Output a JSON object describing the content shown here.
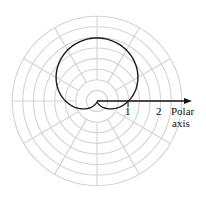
{
  "diagram": {
    "type": "polar-plot",
    "curve_equation_shape": "cardioid",
    "labels": {
      "tick_1": "1",
      "tick_2": "2",
      "axis_line1": "Polar",
      "axis_line2": "axis"
    },
    "colors": {
      "grid": "#d4d4d4",
      "curve": "#1a1a1a",
      "axis": "#111111",
      "background": "#ffffff"
    }
  },
  "chart_data": {
    "type": "line",
    "title": "",
    "coordinate_system": "polar",
    "series": [
      {
        "name": "cardioid r = 1 + sin(theta)",
        "equation": "r = 1 + sin θ",
        "theta_range_deg": [
          0,
          360
        ],
        "samples": [
          {
            "theta_deg": 0,
            "r": 1
          },
          {
            "theta_deg": 30,
            "r": 1.5
          },
          {
            "theta_deg": 60,
            "r": 1.87
          },
          {
            "theta_deg": 90,
            "r": 2
          },
          {
            "theta_deg": 120,
            "r": 1.87
          },
          {
            "theta_deg": 150,
            "r": 1.5
          },
          {
            "theta_deg": 180,
            "r": 1
          },
          {
            "theta_deg": 210,
            "r": 0.5
          },
          {
            "theta_deg": 240,
            "r": 0.13
          },
          {
            "theta_deg": 270,
            "r": 0
          },
          {
            "theta_deg": 300,
            "r": 0.13
          },
          {
            "theta_deg": 330,
            "r": 0.5
          },
          {
            "theta_deg": 360,
            "r": 1
          }
        ]
      }
    ],
    "axis": {
      "label": "Polar axis",
      "tick_labels": [
        "1",
        "2"
      ],
      "tick_values": [
        1,
        2
      ]
    },
    "grid": {
      "on": true,
      "rings": 8,
      "spokes": 12,
      "spoke_spacing_deg": 30
    }
  }
}
